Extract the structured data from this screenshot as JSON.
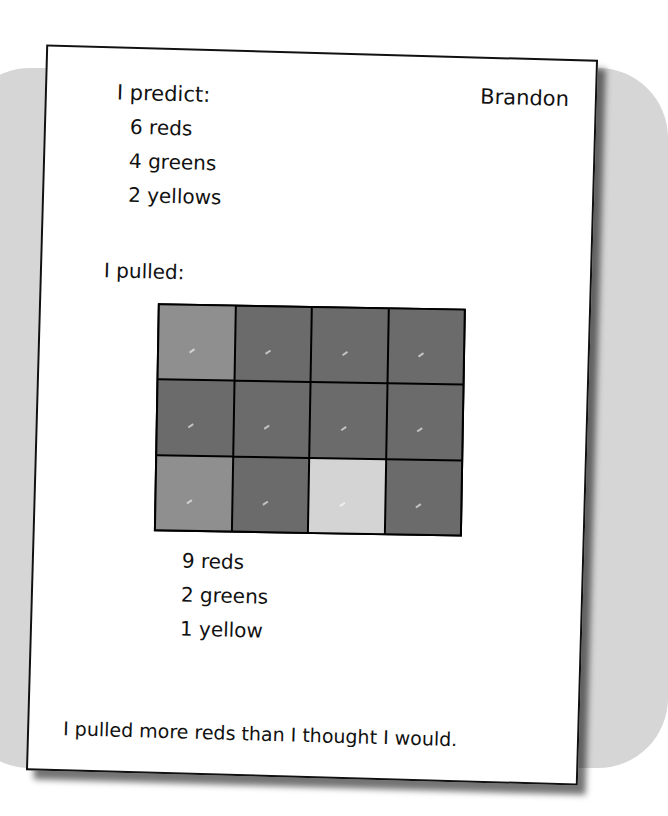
{
  "student_name": "Brandon",
  "prediction": {
    "heading": "I predict:",
    "items": [
      "6 reds",
      "4 greens",
      "2 yellows"
    ]
  },
  "pulled": {
    "heading": "I pulled:",
    "grid": {
      "rows": 3,
      "cols": 4,
      "cells": [
        [
          "green",
          "red",
          "red",
          "red"
        ],
        [
          "red",
          "red",
          "red",
          "red"
        ],
        [
          "green",
          "red",
          "yellow",
          "red"
        ]
      ],
      "tile_colors": {
        "red": "#6b6b6b",
        "green": "#8f8f8f",
        "yellow": "#d4d4d4"
      }
    },
    "results": [
      "9 reds",
      "2 greens",
      "1 yellow"
    ]
  },
  "conclusion": "I pulled more reds than I thought I would."
}
